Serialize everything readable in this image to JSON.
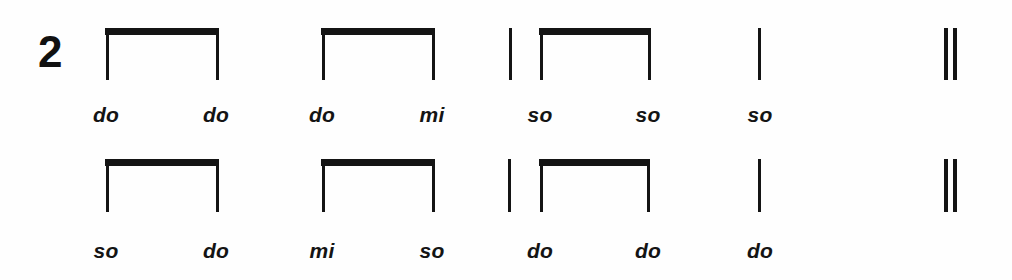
{
  "page": {
    "background_color": "#fefefe",
    "ink_color": "#141414",
    "width": 1012,
    "height": 280
  },
  "notation": {
    "time_signature": "2",
    "systems": [
      {
        "index": 1,
        "stem_top": 28,
        "stem_bottom": 80,
        "beam_y": 28,
        "label_y": 104,
        "measures": [
          {
            "index": 1,
            "groups": [
              {
                "type": "beamed-pair",
                "beam_left": 105,
                "beam_right": 219,
                "stems": [
                  {
                    "x": 106,
                    "syllable": "do",
                    "label_x": 106
                  },
                  {
                    "x": 216,
                    "syllable": "do",
                    "label_x": 216
                  }
                ]
              }
            ]
          },
          {
            "index": 2,
            "groups": [
              {
                "type": "beamed-pair",
                "beam_left": 321,
                "beam_right": 435,
                "stems": [
                  {
                    "x": 322,
                    "syllable": "do",
                    "label_x": 322
                  },
                  {
                    "x": 432,
                    "syllable": "mi",
                    "label_x": 432
                  }
                ]
              }
            ]
          },
          {
            "index": 3,
            "groups": [
              {
                "type": "single",
                "stems": [
                  {
                    "x": 510,
                    "syllable": "so",
                    "label_x": 540
                  }
                ]
              },
              {
                "type": "beamed-pair",
                "beam_left": 539,
                "beam_right": 651,
                "stems": [
                  {
                    "x": 540,
                    "syllable": "so",
                    "label_x": 648
                  },
                  {
                    "x": 648,
                    "syllable": "so",
                    "label_x": 760
                  }
                ]
              }
            ]
          },
          {
            "index": 4,
            "groups": [
              {
                "type": "single",
                "stems": [
                  {
                    "x": 758,
                    "syllable": "",
                    "label_x": 758
                  }
                ]
              }
            ]
          }
        ],
        "final_barline": {
          "x1": 944,
          "x2": 953
        },
        "syllables": [
          {
            "text": "do",
            "x": 106
          },
          {
            "text": "do",
            "x": 216
          },
          {
            "text": "do",
            "x": 322
          },
          {
            "text": "mi",
            "x": 432
          },
          {
            "text": "so",
            "x": 540
          },
          {
            "text": "so",
            "x": 648
          },
          {
            "text": "so",
            "x": 758
          }
        ]
      },
      {
        "index": 2,
        "stem_top": 159,
        "stem_bottom": 212,
        "beam_y": 159,
        "label_y": 240,
        "measures": [
          {
            "index": 1,
            "groups": [
              {
                "type": "beamed-pair",
                "beam_left": 105,
                "beam_right": 219,
                "stems": [
                  {
                    "x": 106,
                    "syllable": "so",
                    "label_x": 106
                  },
                  {
                    "x": 216,
                    "syllable": "do",
                    "label_x": 216
                  }
                ]
              }
            ]
          },
          {
            "index": 2,
            "groups": [
              {
                "type": "beamed-pair",
                "beam_left": 321,
                "beam_right": 435,
                "stems": [
                  {
                    "x": 322,
                    "syllable": "mi",
                    "label_x": 322
                  },
                  {
                    "x": 432,
                    "syllable": "so",
                    "label_x": 432
                  }
                ]
              }
            ]
          },
          {
            "index": 3,
            "groups": [
              {
                "type": "single",
                "stems": [
                  {
                    "x": 509,
                    "syllable": "do",
                    "label_x": 540
                  }
                ]
              },
              {
                "type": "beamed-pair",
                "beam_left": 539,
                "beam_right": 650,
                "stems": [
                  {
                    "x": 540,
                    "syllable": "do",
                    "label_x": 648
                  },
                  {
                    "x": 647,
                    "syllable": "do",
                    "label_x": 760
                  }
                ]
              }
            ]
          },
          {
            "index": 4,
            "groups": [
              {
                "type": "single",
                "stems": [
                  {
                    "x": 758,
                    "syllable": "",
                    "label_x": 758
                  }
                ]
              }
            ]
          }
        ],
        "final_barline": {
          "x1": 944,
          "x2": 953
        },
        "syllables": [
          {
            "text": "so",
            "x": 106
          },
          {
            "text": "do",
            "x": 216
          },
          {
            "text": "mi",
            "x": 322
          },
          {
            "text": "so",
            "x": 432
          },
          {
            "text": "do",
            "x": 540
          },
          {
            "text": "do",
            "x": 648
          },
          {
            "text": "do",
            "x": 758
          }
        ]
      }
    ]
  }
}
